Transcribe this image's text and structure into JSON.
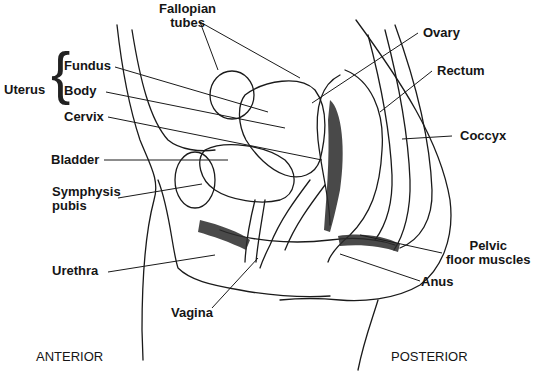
{
  "diagram": {
    "orientation": {
      "left": "ANTERIOR",
      "right": "POSTERIOR"
    },
    "group": {
      "label": "Uterus",
      "parts": [
        "Fundus",
        "Body",
        "Cervix"
      ]
    },
    "labels": {
      "fallopian_1": "Fallopian",
      "fallopian_2": "tubes",
      "fundus": "Fundus",
      "body": "Body",
      "cervix": "Cervix",
      "uterus": "Uterus",
      "bladder": "Bladder",
      "symphysis_1": "Symphysis",
      "symphysis_2": "pubis",
      "urethra": "Urethra",
      "vagina": "Vagina",
      "ovary": "Ovary",
      "rectum": "Rectum",
      "coccyx": "Coccyx",
      "pelvic_1": "Pelvic",
      "pelvic_2": "floor muscles",
      "anus": "Anus",
      "anterior": "ANTERIOR",
      "posterior": "POSTERIOR"
    },
    "colors": {
      "ink": "#151515",
      "background": "#ffffff"
    }
  }
}
